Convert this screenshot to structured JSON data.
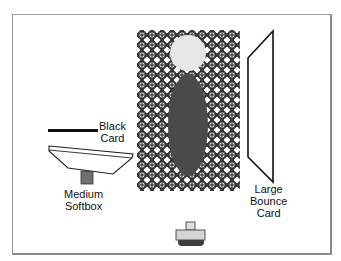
{
  "diagram": {
    "type": "lighting-setup",
    "labels": {
      "black_card": [
        "Black",
        "Card"
      ],
      "medium_softbox": [
        "Medium",
        "Softbox"
      ],
      "large_bounce_card": [
        "Large",
        "Bounce",
        "Card"
      ]
    },
    "colors": {
      "background_pattern_line": "#2a2a2a",
      "subject_head": "#e6e6e6",
      "subject_body": "#4a4a4a",
      "black_card": "#111111",
      "softbox_fill": "#ffffff",
      "softbox_stand": "#707070",
      "camera_body": "#d4d4d4",
      "camera_base": "#3c3c3c",
      "camera_lens": "#dcdcdc",
      "frame": "#9a9a9a"
    }
  }
}
